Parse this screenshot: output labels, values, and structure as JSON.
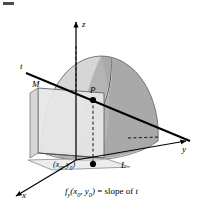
{
  "figure": {
    "type": "math-diagram-3d",
    "axes": {
      "z_label": "z",
      "y_label": "y",
      "x_label": "x"
    },
    "labels": {
      "tangent_line": "t",
      "plane": "M",
      "point": "P",
      "curve": "L",
      "base_point": "(x",
      "base_point_sub1": "0",
      "base_point_mid": ", y",
      "base_point_sub2": "0",
      "base_point_end": ")"
    },
    "caption": {
      "fn": "f",
      "fn_sub": "y",
      "args_open": "(x",
      "args_sub1": "0",
      "args_mid": ", y",
      "args_sub2": "0",
      "args_close": ")",
      "equals": " = ",
      "slope_of": "slope of ",
      "line": "t"
    },
    "colors": {
      "surface_light": "#dcdcdc",
      "surface_mid": "#c4c4c4",
      "surface_dark": "#a9a9a9",
      "plane_fill": "#e6e6e6",
      "plane_side": "#d0d0d0",
      "stroke": "#000000",
      "outline_gray": "#8a8a8a",
      "background": "#ffffff"
    }
  }
}
